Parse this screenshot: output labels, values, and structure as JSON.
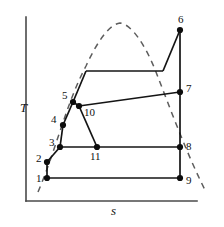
{
  "figure": {
    "width": 224,
    "height": 227,
    "background": "#ffffff"
  },
  "chart_data": {
    "type": "line",
    "title": "",
    "xlabel": "s",
    "ylabel": "T",
    "xlim": [
      26,
      197
    ],
    "ylim": [
      201,
      17
    ],
    "grid": false,
    "legend": null,
    "axis_color": "#4a4a4a",
    "cycle_color": "#141414",
    "dome_color": "#5d5d5d",
    "note": "Axis values are unlabeled; coordinates are in screen pixels with y inverted (T increases upward).",
    "axes": {
      "y_axis": {
        "x": 26,
        "y_top": 17,
        "y_bottom": 201
      },
      "x_axis": {
        "y": 201,
        "x_left": 26,
        "x_right": 197
      }
    },
    "points": [
      {
        "id": "1",
        "label": "1",
        "x": 47,
        "y": 178,
        "label_x": 36,
        "label_y": 182,
        "dot": true
      },
      {
        "id": "2",
        "label": "2",
        "x": 47,
        "y": 162,
        "label_x": 36,
        "label_y": 162,
        "dot": true
      },
      {
        "id": "3",
        "label": "3",
        "x": 60,
        "y": 147,
        "label_x": 49,
        "label_y": 146,
        "dot": true
      },
      {
        "id": "4",
        "label": "4",
        "x": 63,
        "y": 125,
        "label_x": 51,
        "label_y": 123,
        "dot": true
      },
      {
        "id": "5",
        "label": "5",
        "x": 73,
        "y": 102,
        "label_x": 62,
        "label_y": 99,
        "dot": true
      },
      {
        "id": "6",
        "label": "6",
        "x": 180,
        "y": 30,
        "label_x": 178,
        "label_y": 23,
        "dot": true
      },
      {
        "id": "7",
        "label": "7",
        "x": 180,
        "y": 92,
        "label_x": 186,
        "label_y": 92,
        "dot": true
      },
      {
        "id": "8",
        "label": "8",
        "x": 180,
        "y": 147,
        "label_x": 186,
        "label_y": 150,
        "dot": true
      },
      {
        "id": "9",
        "label": "9",
        "x": 180,
        "y": 178,
        "label_x": 186,
        "label_y": 184,
        "dot": true
      },
      {
        "id": "10",
        "label": "10",
        "x": 79,
        "y": 106,
        "label_x": 84,
        "label_y": 116,
        "dot": true
      },
      {
        "id": "11",
        "label": "11",
        "x": 97,
        "y": 147,
        "label_x": 90,
        "label_y": 160,
        "dot": true
      }
    ],
    "segments": [
      {
        "name": "1-9-isobar",
        "path": "M 47,178 L 180,178"
      },
      {
        "name": "1-2-compression",
        "path": "M 47,178 L 47,162"
      },
      {
        "name": "2-3-heating",
        "path": "M 47,162 L 60,147"
      },
      {
        "name": "3-11-isobar",
        "path": "M 60,147 L 97,147"
      },
      {
        "name": "11-8-isobar",
        "path": "M 97,147 L 180,147"
      },
      {
        "name": "3-4-compression",
        "path": "M 60,147 L 63,125"
      },
      {
        "name": "4-5-heating",
        "path": "M 63,125 L 73,102"
      },
      {
        "name": "5-10-link",
        "path": "M 73,102 L 79,106"
      },
      {
        "name": "10-11-expansion",
        "path": "M 79,106 L 97,147"
      },
      {
        "name": "10-7-isobar",
        "path": "M 79,106 L 180,92"
      },
      {
        "name": "5-upper-rise",
        "path": "M 73,102 L 86,71"
      },
      {
        "name": "upper-isotherm",
        "path": "M 86,71 L 163,71"
      },
      {
        "name": "upper-to-6",
        "path": "M 163,71 L 180,30"
      },
      {
        "name": "6-9-expansion",
        "path": "M 180,30 L 180,178"
      }
    ],
    "dome": {
      "name": "saturation-dome",
      "path": "M 38,192 C 56,150 66,104 86,66 C 98,40 110,24 120,23 C 131,24 145,44 156,72 C 170,108 186,152 205,190",
      "dashed": true,
      "peak": {
        "x": 120,
        "y": 23
      }
    },
    "axis_labels": {
      "y": {
        "text": "T",
        "x": 20,
        "y": 112,
        "italic": true
      },
      "x": {
        "text": "s",
        "x": 111,
        "y": 215,
        "italic": true
      }
    }
  }
}
